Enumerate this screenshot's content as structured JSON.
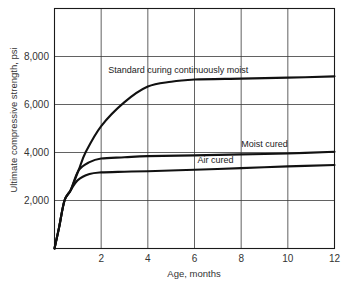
{
  "chart_data": {
    "type": "line",
    "title": "",
    "xlabel": "Age, months",
    "ylabel": "Ultimate compressive strength, psi",
    "xlim": [
      0,
      12
    ],
    "ylim": [
      0,
      10000
    ],
    "grid": true,
    "legend_position": "inline labels",
    "x_ticks": [
      2,
      4,
      6,
      8,
      10,
      12
    ],
    "x_tick_labels": [
      "2",
      "4",
      "6",
      "8",
      "10",
      "12"
    ],
    "y_ticks": [
      2000,
      4000,
      6000,
      8000
    ],
    "y_tick_labels": [
      "2,000",
      "4,000",
      "6,000",
      "8,000"
    ],
    "series": [
      {
        "name": "Standard curing continuously moist",
        "x": [
          0,
          0.2,
          0.43,
          0.69,
          1.03,
          1.33,
          2,
          3,
          4,
          5,
          6,
          8,
          10,
          12
        ],
        "values": [
          0,
          900,
          2000,
          2420,
          3250,
          4000,
          5100,
          6100,
          6750,
          6950,
          7040,
          7080,
          7120,
          7170
        ]
      },
      {
        "name": "Moist cured",
        "x": [
          0,
          0.2,
          0.43,
          0.69,
          1.03,
          1.5,
          2,
          3,
          4,
          6,
          8,
          10,
          12
        ],
        "values": [
          0,
          900,
          2000,
          2420,
          3250,
          3600,
          3750,
          3800,
          3850,
          3880,
          3920,
          3960,
          4030
        ]
      },
      {
        "name": "Air cured",
        "x": [
          0,
          0.2,
          0.43,
          0.69,
          1,
          1.5,
          2,
          3,
          4,
          6,
          8,
          10,
          12
        ],
        "values": [
          0,
          900,
          2000,
          2420,
          2850,
          3100,
          3170,
          3200,
          3220,
          3280,
          3350,
          3420,
          3480
        ]
      }
    ],
    "annotations": [
      {
        "text": "Standard curing continuously moist",
        "x": 5.3,
        "y": 7300
      },
      {
        "text": "Moist cured",
        "x": 9.0,
        "y": 4250
      },
      {
        "text": "Air cured",
        "x": 6.9,
        "y": 3550
      }
    ]
  }
}
